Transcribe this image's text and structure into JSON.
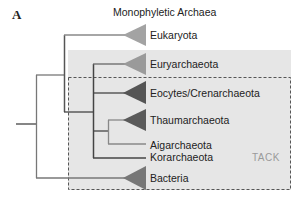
{
  "panel": {
    "letter": "A",
    "title": "Monophyletic Archaea"
  },
  "groups": {
    "archaea_box": {
      "fill": "#e6e6e6"
    },
    "tack_box": {
      "label": "TACK",
      "border": "dashed",
      "color": "#555555"
    }
  },
  "taxa": [
    {
      "name": "Eukaryota",
      "triangle_color": "#a3a3a3"
    },
    {
      "name": "Euryarchaeota",
      "triangle_color": "#9a9a9a"
    },
    {
      "name": "Eocytes/Crenarchaeota",
      "triangle_color": "#555555"
    },
    {
      "name": "Thaumarchaeota",
      "triangle_color": "#5a5a5a"
    },
    {
      "name": "Aigarchaeota",
      "triangle_color": null
    },
    {
      "name": "Korarchaeota",
      "triangle_color": null
    },
    {
      "name": "Bacteria",
      "triangle_color": "#777777"
    }
  ]
}
